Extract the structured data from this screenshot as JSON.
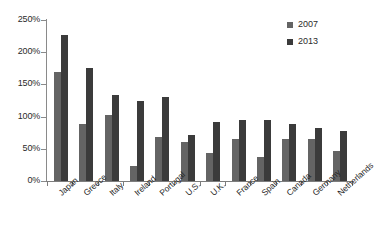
{
  "chart_data": {
    "type": "bar",
    "title": "",
    "subtitle": "",
    "xlabel": "",
    "ylabel": "",
    "ylim": [
      0,
      250
    ],
    "ytick_values": [
      250,
      200,
      150,
      100,
      50,
      0
    ],
    "ytick_labels": [
      "250%",
      "200%",
      "150%",
      "100%",
      "50%",
      "0%"
    ],
    "grid": false,
    "legend_position": "top-right",
    "categories": [
      "Japan",
      "Greece",
      "Italy",
      "Ireland",
      "Portugal",
      "U.S.",
      "U.K.",
      "France",
      "Spain",
      "Canada",
      "Germany",
      "Netherlands"
    ],
    "series": [
      {
        "name": "2007",
        "color": "#646464",
        "values": [
          169,
          89,
          103,
          24,
          68,
          61,
          44,
          65,
          37,
          65,
          66,
          47
        ]
      },
      {
        "name": "2013",
        "color": "#3b3b3b",
        "values": [
          226,
          175,
          133,
          124,
          130,
          72,
          91,
          94,
          95,
          88,
          82,
          77
        ]
      }
    ]
  },
  "legend": {
    "entries": [
      {
        "label": "2007",
        "color": "#646464"
      },
      {
        "label": "2013",
        "color": "#3b3b3b"
      }
    ]
  },
  "axes": {
    "y_axis_color": "#8a8a8a",
    "x_axis_color": "#7d7d7d"
  }
}
